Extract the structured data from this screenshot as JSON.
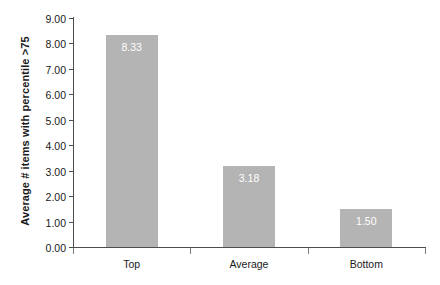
{
  "chart_data": {
    "type": "bar",
    "title": "",
    "subtitle": "",
    "xlabel": "",
    "ylabel": "Average # items with percentile >75",
    "categories": [
      "Top",
      "Average",
      "Bottom"
    ],
    "values": [
      8.33,
      3.18,
      1.5
    ],
    "data_labels": [
      "8.33",
      "3.18",
      "1.50"
    ],
    "ylim": [
      0,
      9
    ],
    "ytick_step": 1,
    "ytick_labels": [
      "9.00",
      "8.00",
      "7.00",
      "6.00",
      "5.00",
      "4.00",
      "3.00",
      "2.00",
      "1.00",
      "0.00"
    ],
    "ytick_values": [
      9,
      8,
      7,
      6,
      5,
      4,
      3,
      2,
      1,
      0
    ],
    "grid": false,
    "legend": false,
    "legend_position": "none",
    "series": [
      {
        "name": "Average # items with percentile >75",
        "values": [
          8.33,
          3.18,
          1.5
        ]
      }
    ]
  },
  "style": {
    "bar_color": "#b4b4b4",
    "data_label_color": "#ffffff",
    "axis_color": "#4d4d4d",
    "text_color": "#1a1a1a",
    "background": "#ffffff"
  }
}
